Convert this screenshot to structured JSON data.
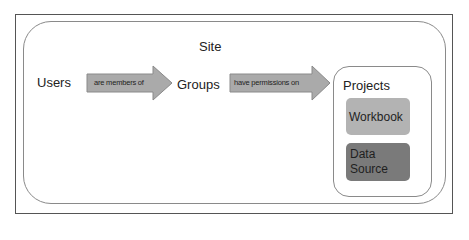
{
  "diagram": {
    "site": {
      "title": "Site"
    },
    "nodes": {
      "users": "Users",
      "groups": "Groups"
    },
    "relations": [
      {
        "from": "Users",
        "to": "Groups",
        "label": "are members of"
      },
      {
        "from": "Groups",
        "to": "Projects",
        "label": "have permissions on"
      }
    ],
    "projects": {
      "title": "Projects",
      "items": [
        {
          "label": "Workbook",
          "color": "#b3b3b3"
        },
        {
          "label_line1": "Data",
          "label_line2": "Source",
          "color": "#7a7a7a"
        }
      ]
    },
    "colors": {
      "arrow_fill": "#aaaaaa",
      "arrow_stroke": "#8a8a8a",
      "frame_border": "#555555",
      "container_border": "#8a8a8a"
    }
  }
}
